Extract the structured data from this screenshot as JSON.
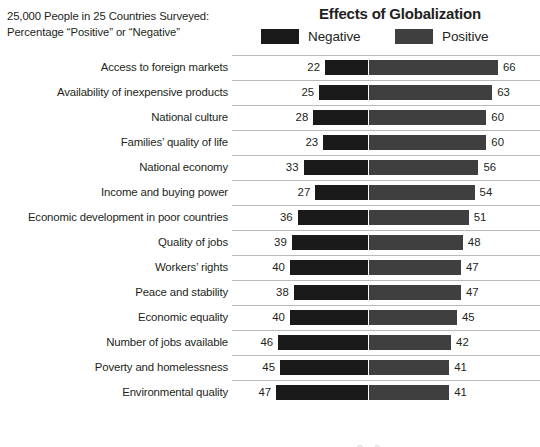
{
  "header": {
    "subtitle_line1": "25,000 People in 25 Countries Surveyed:",
    "subtitle_line2": "Percentage “Positive” or “Negative”",
    "title": "Effects of Globalization"
  },
  "legend": {
    "negative_label": "Negative",
    "positive_label": "Positive",
    "negative_color": "#1a1a1a",
    "positive_color": "#3f3f3f"
  },
  "chart_data": {
    "type": "bar",
    "title": "Effects of Globalization",
    "subtitle": "25,000 People in 25 Countries Surveyed: Percentage “Positive” or “Negative”",
    "xlabel": "",
    "ylabel": "",
    "orientation": "horizontal-diverging",
    "unit": "percent",
    "grid": false,
    "legend_position": "top",
    "categories": [
      "Access to foreign markets",
      "Availability of inexpensive products",
      "National culture",
      "Families’ quality of life",
      "National economy",
      "Income and buying power",
      "Economic development in poor countries",
      "Quality of jobs",
      "Workers’ rights",
      "Peace and stability",
      "Economic equality",
      "Number of jobs available",
      "Poverty and homelessness",
      "Environmental quality"
    ],
    "series": [
      {
        "name": "Negative",
        "color": "#1a1a1a",
        "values": [
          22,
          25,
          28,
          23,
          33,
          27,
          36,
          39,
          40,
          38,
          40,
          46,
          45,
          47
        ]
      },
      {
        "name": "Positive",
        "color": "#3f3f3f",
        "values": [
          66,
          63,
          60,
          60,
          56,
          54,
          51,
          48,
          47,
          47,
          45,
          42,
          41,
          41
        ]
      }
    ]
  },
  "rows": [
    {
      "label": "Access to foreign markets",
      "negative": 22,
      "positive": 66
    },
    {
      "label": "Availability of inexpensive products",
      "negative": 25,
      "positive": 63
    },
    {
      "label": "National culture",
      "negative": 28,
      "positive": 60
    },
    {
      "label": "Families’ quality of life",
      "negative": 23,
      "positive": 60
    },
    {
      "label": "National economy",
      "negative": 33,
      "positive": 56
    },
    {
      "label": "Income and buying power",
      "negative": 27,
      "positive": 54
    },
    {
      "label": "Economic development in poor countries",
      "negative": 36,
      "positive": 51
    },
    {
      "label": "Quality of jobs",
      "negative": 39,
      "positive": 48
    },
    {
      "label": "Workers’ rights",
      "negative": 40,
      "positive": 47
    },
    {
      "label": "Peace and stability",
      "negative": 38,
      "positive": 47
    },
    {
      "label": "Economic equality",
      "negative": 40,
      "positive": 45
    },
    {
      "label": "Number of jobs available",
      "negative": 46,
      "positive": 42
    },
    {
      "label": "Poverty and homelessness",
      "negative": 45,
      "positive": 41
    },
    {
      "label": "Environmental quality",
      "negative": 47,
      "positive": 41
    }
  ],
  "scale": {
    "px_per_unit": 1.955,
    "gap_px": 1
  }
}
